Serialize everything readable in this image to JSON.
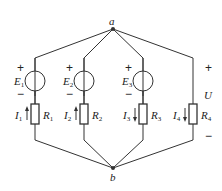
{
  "nodes": {
    "a": "a",
    "b": "b"
  },
  "branches": [
    {
      "source": {
        "name": "E",
        "sub": "1",
        "plus": "+",
        "minus": "−"
      },
      "current": {
        "name": "I",
        "sub": "1",
        "direction": "up"
      },
      "resistor": {
        "name": "R",
        "sub": "1"
      }
    },
    {
      "source": {
        "name": "E",
        "sub": "2",
        "plus": "+",
        "minus": "−"
      },
      "current": {
        "name": "I",
        "sub": "2",
        "direction": "up"
      },
      "resistor": {
        "name": "R",
        "sub": "2"
      }
    },
    {
      "source": {
        "name": "E",
        "sub": "3",
        "plus": "+",
        "minus": "−"
      },
      "current": {
        "name": "I",
        "sub": "3",
        "direction": "down"
      },
      "resistor": {
        "name": "R",
        "sub": "3"
      }
    },
    {
      "current": {
        "name": "I",
        "sub": "4",
        "direction": "down"
      },
      "resistor": {
        "name": "R",
        "sub": "4"
      }
    }
  ],
  "voltage": {
    "name": "U",
    "plus": "+",
    "minus": "−"
  },
  "colors": {
    "wire": "#333333"
  }
}
